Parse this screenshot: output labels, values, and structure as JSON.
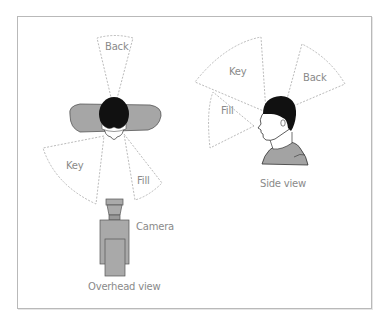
{
  "diagram": {
    "overhead": {
      "caption": "Overhead view",
      "lights": {
        "back": "Back",
        "key": "Key",
        "fill": "Fill"
      },
      "camera_label": "Camera"
    },
    "side": {
      "caption": "Side view",
      "lights": {
        "key": "Key",
        "back": "Back",
        "fill": "Fill"
      }
    },
    "colors": {
      "frame": "#b9b9b9",
      "cone_stroke": "#a8a8a8",
      "shoulders_fill": "#a6a6a6",
      "hair": "#111111",
      "camera_fill": "#a9a9a9",
      "label": "#8a8a8a"
    }
  }
}
